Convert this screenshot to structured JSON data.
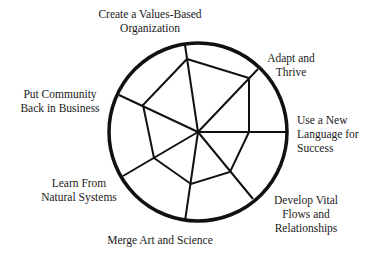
{
  "diagram": {
    "type": "radial-web",
    "colors": {
      "stroke": "#111111",
      "text": "#1a1a1a",
      "background": "#ffffff"
    },
    "center": [
      198,
      132
    ],
    "radius": 89,
    "spokes": [
      {
        "id": "values",
        "outer": [
          185,
          45
        ],
        "vertex": [
          187,
          59
        ]
      },
      {
        "id": "adapt",
        "outer": [
          258,
          69
        ],
        "vertex": [
          249,
          78
        ]
      },
      {
        "id": "language",
        "outer": [
          286,
          132
        ],
        "vertex": [
          249,
          132
        ]
      },
      {
        "id": "flows",
        "outer": [
          253,
          199
        ],
        "vertex": [
          230,
          172
        ]
      },
      {
        "id": "merge",
        "outer": [
          185,
          221
        ],
        "vertex": [
          191,
          184
        ]
      },
      {
        "id": "natural",
        "outer": [
          123,
          176
        ],
        "vertex": [
          154,
          158
        ]
      },
      {
        "id": "community",
        "outer": [
          119,
          95
        ],
        "vertex": [
          143,
          105
        ]
      }
    ],
    "labels": [
      {
        "id": "values",
        "lines": [
          "Create a Values-Based",
          "Organization"
        ],
        "x": 150,
        "y": 18,
        "anchor": "middle"
      },
      {
        "id": "adapt",
        "lines": [
          "Adapt and",
          "Thrive"
        ],
        "x": 291,
        "y": 62,
        "anchor": "middle"
      },
      {
        "id": "language",
        "lines": [
          "Use a New",
          "Language for",
          "Success"
        ],
        "x": 297,
        "y": 124,
        "anchor": "start"
      },
      {
        "id": "flows",
        "lines": [
          "Develop Vital",
          "Flows and",
          "Relationships"
        ],
        "x": 306,
        "y": 204,
        "anchor": "middle"
      },
      {
        "id": "merge",
        "lines": [
          "Merge Art and Science"
        ],
        "x": 160,
        "y": 244,
        "anchor": "middle"
      },
      {
        "id": "natural",
        "lines": [
          "Learn From",
          "Natural Systems"
        ],
        "x": 79,
        "y": 187,
        "anchor": "middle"
      },
      {
        "id": "community",
        "lines": [
          "Put Community",
          "Back in Business"
        ],
        "x": 60,
        "y": 98,
        "anchor": "middle"
      }
    ],
    "line_height": 14
  }
}
